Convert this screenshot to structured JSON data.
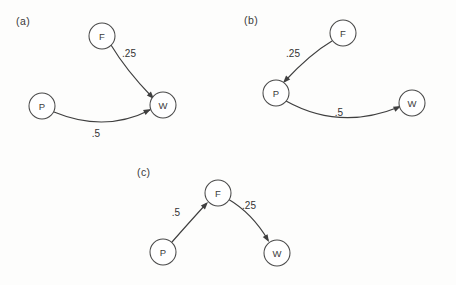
{
  "figure": {
    "background_color": "#fdfdfc",
    "ink_color": "#3f3f3f",
    "node_fill_color": "#ffffff",
    "panels": [
      {
        "label": "(a)",
        "label_x": 16,
        "label_y": 25,
        "nodes": [
          {
            "id": "F",
            "label": "F",
            "cx": 102,
            "cy": 36,
            "r": 13
          },
          {
            "id": "P",
            "label": "P",
            "cx": 42,
            "cy": 106,
            "r": 13
          },
          {
            "id": "W",
            "label": "W",
            "cx": 163,
            "cy": 105,
            "r": 13
          }
        ],
        "edges": [
          {
            "from": "F",
            "to": "W",
            "weight": ".25",
            "weight_x": 129,
            "weight_y": 53,
            "path": "M 111 45 Q 126 70 152 97",
            "arrow_x": 154,
            "arrow_y": 99,
            "arrow_angle": 47
          },
          {
            "from": "P",
            "to": "W",
            "weight": ".5",
            "weight_x": 96,
            "weight_y": 133,
            "path": "M 54 112 Q 105 133 150 110",
            "arrow_x": 151,
            "arrow_y": 109,
            "arrow_angle": -27
          }
        ]
      },
      {
        "label": "(b)",
        "label_x": 244,
        "label_y": 24,
        "nodes": [
          {
            "id": "F",
            "label": "F",
            "cx": 343,
            "cy": 33,
            "r": 13
          },
          {
            "id": "P",
            "label": "P",
            "cx": 276,
            "cy": 93,
            "r": 13
          },
          {
            "id": "W",
            "label": "W",
            "cx": 412,
            "cy": 103,
            "r": 13
          }
        ],
        "edges": [
          {
            "from": "F",
            "to": "P",
            "weight": ".25",
            "weight_x": 293,
            "weight_y": 53,
            "path": "M 332 41 Q 310 54 285 81",
            "arrow_x": 283,
            "arrow_y": 83,
            "arrow_angle": 133
          },
          {
            "from": "P",
            "to": "W",
            "weight": ".5",
            "weight_x": 339,
            "weight_y": 112,
            "path": "M 286 101 Q 340 131 399 107",
            "arrow_x": 401,
            "arrow_y": 106,
            "arrow_angle": -25
          }
        ]
      },
      {
        "label": "(c)",
        "label_x": 137,
        "label_y": 176,
        "nodes": [
          {
            "id": "F",
            "label": "F",
            "cx": 218,
            "cy": 193,
            "r": 13
          },
          {
            "id": "P",
            "label": "P",
            "cx": 163,
            "cy": 252,
            "r": 13
          },
          {
            "id": "W",
            "label": "W",
            "cx": 277,
            "cy": 253,
            "r": 13
          }
        ],
        "edges": [
          {
            "from": "P",
            "to": "F",
            "weight": ".5",
            "weight_x": 176,
            "weight_y": 212,
            "path": "M 172 242 Q 186 226 206 204",
            "arrow_x": 208,
            "arrow_y": 202,
            "arrow_angle": -47
          },
          {
            "from": "F",
            "to": "W",
            "weight": ".25",
            "weight_x": 249,
            "weight_y": 205,
            "path": "M 228 199 Q 252 213 268 240",
            "arrow_x": 269,
            "arrow_y": 242,
            "arrow_angle": 59
          }
        ]
      }
    ]
  }
}
